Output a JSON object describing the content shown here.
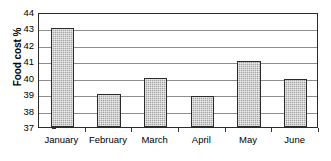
{
  "chart_data": {
    "type": "bar",
    "title": "",
    "xlabel": "",
    "ylabel": "Food cost %",
    "categories": [
      "January",
      "February",
      "March",
      "April",
      "May",
      "June"
    ],
    "values": [
      43,
      39,
      40,
      38.9,
      41,
      39.9
    ],
    "ylim": [
      37,
      44
    ],
    "ytick_labels": [
      "44",
      "43",
      "42",
      "41",
      "40",
      "39",
      "38",
      "37"
    ],
    "ytick_values": [
      44,
      43,
      42,
      41,
      40,
      39,
      38,
      37
    ],
    "grid": "horizontal",
    "legend": "none",
    "series": [
      {
        "name": "Food cost %",
        "values": [
          43,
          39,
          40,
          38.9,
          41,
          39.9
        ]
      }
    ]
  },
  "style": {
    "bar_fill": "#a3a3a3",
    "bar_border": "#2b2b2b",
    "gridline_color": "#8d8d8d",
    "frame_color": "#2b2b2b",
    "background": "#ffffff",
    "text_color": "#000000"
  }
}
